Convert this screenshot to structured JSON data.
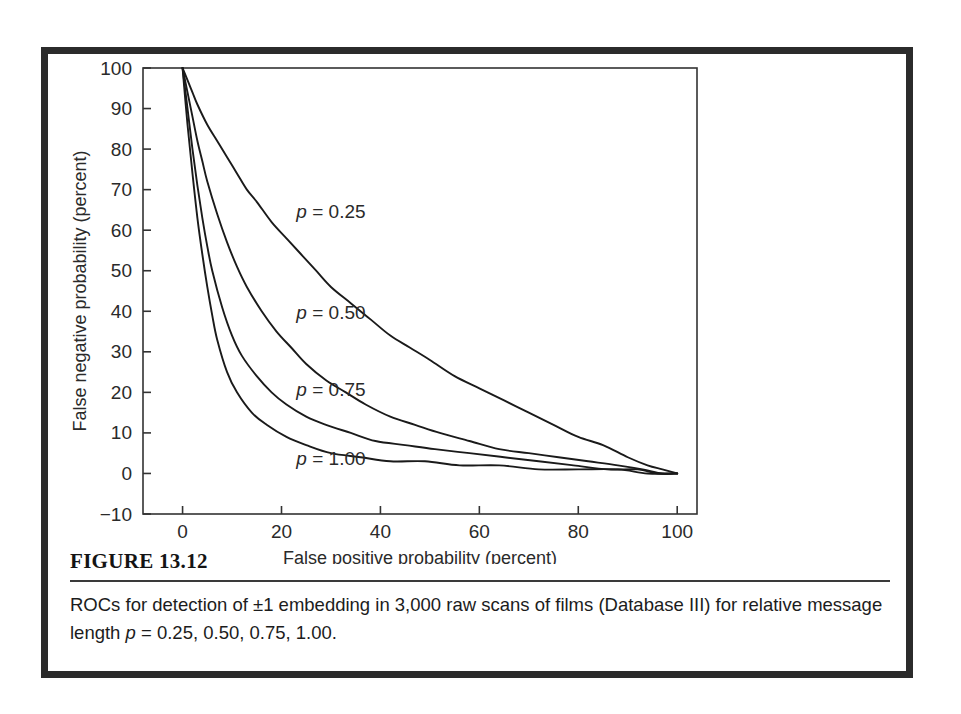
{
  "figure": {
    "number_label": "FIGURE 13.12",
    "caption_prefix": "ROCs for detection of ±1 embedding in 3,000 raw scans of films (Database III) for relative message length ",
    "caption_italic_p": "p",
    "caption_suffix": " = 0.25, 0.50, 0.75, 1.00."
  },
  "chart_data": {
    "type": "line",
    "title": "",
    "xlabel": "False positive probability (percent)",
    "ylabel": "False negative probability (percent)",
    "xlim": [
      -8,
      104
    ],
    "ylim": [
      -10,
      100
    ],
    "xticks": [
      0,
      20,
      40,
      60,
      80,
      100
    ],
    "xticklabels": [
      "0",
      "20",
      "40",
      "60",
      "80",
      "100"
    ],
    "yticks": [
      -10,
      0,
      10,
      20,
      30,
      40,
      50,
      60,
      70,
      80,
      90,
      100
    ],
    "yticklabels": [
      "−10",
      "0",
      "10",
      "20",
      "30",
      "40",
      "50",
      "60",
      "70",
      "80",
      "90",
      "100"
    ],
    "grid": false,
    "legend_position": "inline-annotations",
    "line_color": "#1a1a1a",
    "series": [
      {
        "name": "p = 0.25",
        "label_text": "p = 0.25",
        "label_p": "p",
        "label_rest": " = 0.25",
        "label_x": 23,
        "label_y": 63,
        "x": [
          0,
          1,
          2,
          3,
          5,
          7,
          9,
          11,
          13,
          15,
          18,
          21,
          24,
          27,
          30,
          34,
          38,
          42,
          46,
          50,
          55,
          60,
          65,
          70,
          75,
          80,
          85,
          90,
          94,
          97,
          100
        ],
        "y": [
          100,
          97,
          94,
          91,
          86,
          82,
          78,
          74,
          70,
          67,
          62,
          58,
          54,
          50,
          46,
          42,
          38,
          34,
          31,
          28,
          24,
          21,
          18,
          15,
          12,
          9,
          7,
          4,
          2,
          1,
          0
        ]
      },
      {
        "name": "p = 0.50",
        "label_text": "p = 0.50",
        "label_p": "p",
        "label_rest": " = 0.50",
        "label_x": 23,
        "label_y": 38,
        "x": [
          0,
          1,
          2,
          3,
          4,
          5,
          7,
          9,
          11,
          13,
          16,
          19,
          22,
          25,
          29,
          33,
          37,
          42,
          47,
          52,
          58,
          64,
          70,
          76,
          82,
          88,
          93,
          97,
          100
        ],
        "y": [
          100,
          94,
          88,
          82,
          77,
          72,
          64,
          57,
          51,
          46,
          40,
          35,
          31,
          27,
          23,
          20,
          17,
          14,
          12,
          10,
          8,
          6,
          5,
          4,
          3,
          2,
          1,
          0,
          0
        ]
      },
      {
        "name": "p = 0.75",
        "label_text": "p = 0.75",
        "label_p": "p",
        "label_rest": " = 0.75",
        "label_x": 23,
        "label_y": 19,
        "x": [
          0,
          1,
          2,
          3,
          4,
          5,
          6,
          8,
          10,
          12,
          15,
          18,
          21,
          25,
          29,
          34,
          39,
          45,
          51,
          58,
          65,
          72,
          79,
          86,
          92,
          96,
          100
        ],
        "y": [
          100,
          90,
          80,
          71,
          63,
          56,
          50,
          41,
          34,
          29,
          24,
          20,
          17,
          14,
          12,
          10,
          8,
          7,
          6,
          5,
          4,
          3,
          2,
          1,
          1,
          0,
          0
        ]
      },
      {
        "name": "p = 1.00",
        "label_text": "p = 1.00",
        "label_p": "p",
        "label_rest": " = 1.00",
        "label_x": 23,
        "label_y": 2,
        "x": [
          0,
          1,
          2,
          3,
          4,
          5,
          6,
          7,
          9,
          11,
          14,
          17,
          21,
          25,
          30,
          36,
          42,
          49,
          56,
          64,
          72,
          80,
          88,
          94,
          100
        ],
        "y": [
          100,
          86,
          74,
          63,
          54,
          46,
          39,
          33,
          25,
          20,
          15,
          12,
          9,
          7,
          5,
          4,
          3,
          3,
          2,
          2,
          1,
          1,
          1,
          0,
          0
        ]
      }
    ]
  }
}
